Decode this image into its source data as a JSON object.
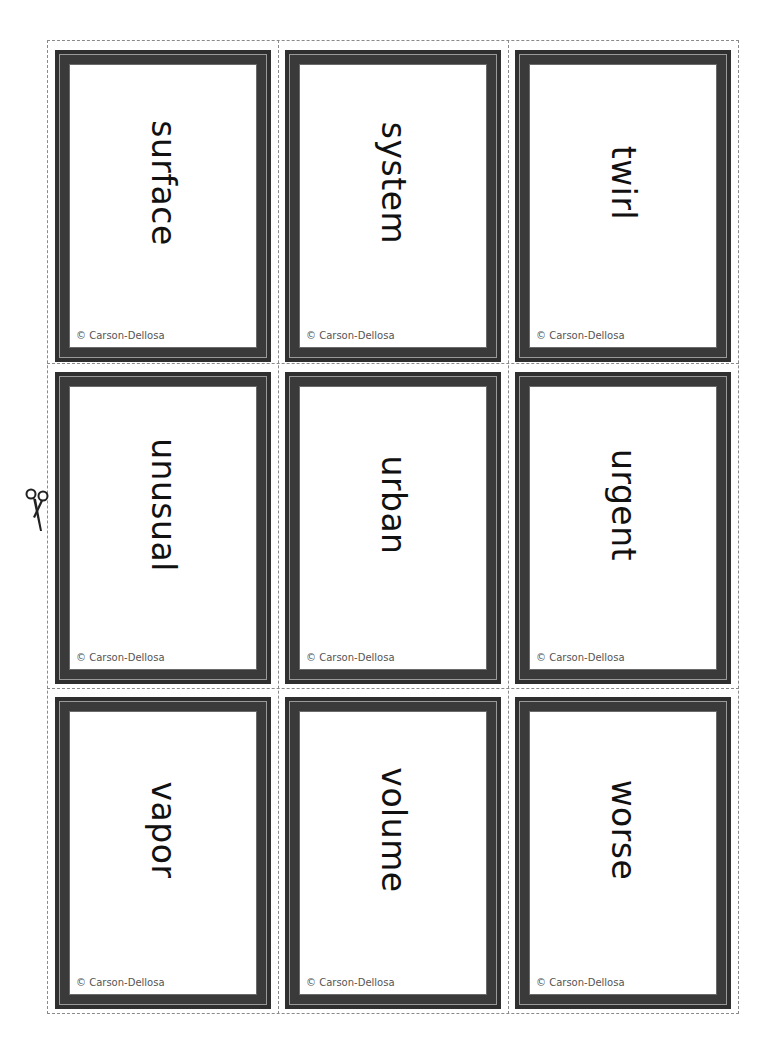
{
  "cards": [
    {
      "word": "surface",
      "copyright": "© Carson-Dellosa"
    },
    {
      "word": "system",
      "copyright": "© Carson-Dellosa"
    },
    {
      "word": "twirl",
      "copyright": "© Carson-Dellosa"
    },
    {
      "word": "unusual",
      "copyright": "© Carson-Dellosa"
    },
    {
      "word": "urban",
      "copyright": "© Carson-Dellosa"
    },
    {
      "word": "urgent",
      "copyright": "© Carson-Dellosa"
    },
    {
      "word": "vapor",
      "copyright": "© Carson-Dellosa"
    },
    {
      "word": "volume",
      "copyright": "© Carson-Dellosa"
    },
    {
      "word": "worse",
      "copyright": "© Carson-Dellosa"
    }
  ],
  "icons": {
    "cut_guide": "scissors-icon"
  },
  "colors": {
    "frame": "#2f2f2f",
    "frame_line": "#9a9a9a",
    "dash": "#8a8a8a"
  }
}
